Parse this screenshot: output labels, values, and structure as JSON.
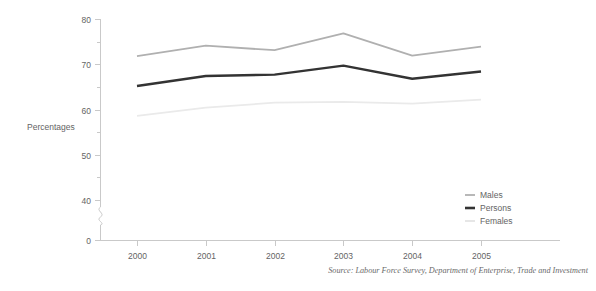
{
  "chart_data": {
    "type": "line",
    "title": "",
    "xlabel": "",
    "ylabel": "Percentages",
    "categories": [
      "2000",
      "2001",
      "2002",
      "2003",
      "2004",
      "2005"
    ],
    "x": [
      2000,
      2001,
      2002,
      2003,
      2004,
      2005
    ],
    "series": [
      {
        "name": "Males",
        "color": "#b0b0b0",
        "width": 1.8,
        "values": [
          71.8,
          74.1,
          73.1,
          76.8,
          71.9,
          73.9
        ]
      },
      {
        "name": "Persons",
        "color": "#333333",
        "width": 2.4,
        "values": [
          65.2,
          67.4,
          67.7,
          69.7,
          66.8,
          68.4
        ]
      },
      {
        "name": "Females",
        "color": "#eaeaea",
        "width": 1.8,
        "values": [
          58.6,
          60.4,
          61.5,
          61.7,
          61.3,
          62.2
        ]
      }
    ],
    "ylim": [
      40,
      80
    ],
    "yticks": [
      40,
      50,
      60,
      70,
      80
    ],
    "yticks_minor": [
      45,
      55,
      65,
      75
    ],
    "ytick_labels": [
      "40",
      "50",
      "60",
      "70",
      "80"
    ],
    "y_zero_label": "0",
    "axis_break": true,
    "grid": false,
    "legend_position": "right-inside"
  },
  "axis": {
    "y_title": "Percentages",
    "y_labels": [
      "80",
      "70",
      "60",
      "50",
      "40",
      "0"
    ],
    "x_labels": [
      "2000",
      "2001",
      "2002",
      "2003",
      "2004",
      "2005"
    ]
  },
  "legend": {
    "items": [
      {
        "label": "Males",
        "color": "#b0b0b0"
      },
      {
        "label": "Persons",
        "color": "#333333"
      },
      {
        "label": "Females",
        "color": "#e4e4e4"
      }
    ]
  },
  "footer": {
    "source": "Source: Labour Force Survey, Department of Enterprise, Trade and Investment"
  }
}
